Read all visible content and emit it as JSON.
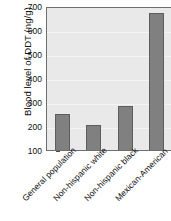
{
  "chart_data": {
    "type": "bar",
    "title": "",
    "xlabel": "",
    "ylabel": "Blood level of DDT (ng/g)",
    "categories": [
      "General population",
      "Non-hispanic white",
      "Non-hispanic black",
      "Mexican-American"
    ],
    "values": [
      260,
      212,
      292,
      678
    ],
    "ylim": [
      100,
      700
    ],
    "yticks": [
      100,
      200,
      300,
      400,
      500,
      600,
      700
    ],
    "ytick_labels": [
      "100",
      "200",
      "300",
      "400",
      "500",
      "600",
      "700"
    ],
    "grid": true,
    "legend": false,
    "bar_color": "#808080",
    "bar_edge_color": "#5d5d5d",
    "plot_background": "#e9e9e9",
    "axis_color": "#6f6f6f"
  }
}
